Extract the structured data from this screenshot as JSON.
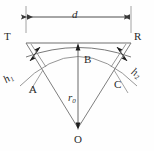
{
  "figure": {
    "type": "geometry-diagram",
    "background_color": "#fefefe",
    "stroke_color": "#4a4a4a",
    "text_color": "#2b2b2b",
    "labels": {
      "dimension_d": "d",
      "point_T": "T",
      "point_R": "R",
      "point_A": "A",
      "point_B": "B",
      "point_C": "C",
      "point_O": "O",
      "radius": "r",
      "radius_sub": "0",
      "offset_left": "h",
      "offset_left_sub": "1",
      "offset_right": "h",
      "offset_right_sub": "2"
    },
    "geometry": {
      "chord_left_x": 26,
      "chord_right_x": 131,
      "chord_y": 43,
      "center_x": 78,
      "center_y": 128,
      "dimension_line_y": 17,
      "arc_apex_y": 43,
      "arc_sag": 16
    }
  }
}
